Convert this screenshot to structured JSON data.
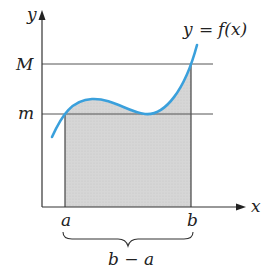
{
  "figure": {
    "type": "mean-value / integral bounds diagram",
    "axes": {
      "x_label": "x",
      "y_label": "y"
    },
    "curve_label": "y = f(x)",
    "curve_label_parts": {
      "lhs": "y",
      "eq": "=",
      "rhs": "f(x)"
    },
    "horizontal_lines": [
      {
        "label": "M",
        "meaning": "maximum"
      },
      {
        "label": "m",
        "meaning": "minimum"
      }
    ],
    "x_ticks": [
      {
        "label": "a"
      },
      {
        "label": "b"
      }
    ],
    "brace_label": "b − a",
    "colors": {
      "curve": "#3aa0dc",
      "shade": "#d4d4d4",
      "axis": "#333333",
      "guide_line": "#555555"
    }
  }
}
